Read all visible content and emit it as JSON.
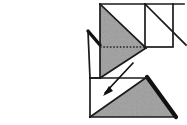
{
  "figure": {
    "kind": "origami-folding-diagram",
    "title": "",
    "caption": "",
    "background_color": "#ffffff",
    "ink_color": "#1a1a1a",
    "shaded_color": "#9d9d9d",
    "shaded_color_dark": "#8a8a8a",
    "white_color": "#ffffff",
    "crease_style": "dotted",
    "stroke_width": 1.6
  },
  "canvas": {
    "width": 187,
    "height": 125
  },
  "regions": [
    {
      "name": "upper-right-white-square",
      "fill": "white",
      "points": "100,4 173,4 173,47 145,47 145,4"
    },
    {
      "name": "upper-right-white-triangle",
      "fill": "white",
      "points": "145,4 185,4 145,47"
    },
    {
      "name": "upper-shaded-triangle",
      "fill": "shaded",
      "points": "100,4 145,47 100,78"
    },
    {
      "name": "upper-shaded-lower-wedge",
      "fill": "shaded",
      "points": "100,47 145,47 145,78 100,78"
    },
    {
      "name": "left-white-flap",
      "fill": "white",
      "points": "88,31 100,31 100,78 88,78"
    },
    {
      "name": "lower-left-white-square",
      "fill": "white",
      "points": "90,78 145,78 90,117"
    },
    {
      "name": "lower-shaded-triangle",
      "fill": "shaded",
      "points": "145,78 175,117 90,117"
    }
  ],
  "edges": [
    {
      "name": "top-edge",
      "d": "M 100,4 L 184,4"
    },
    {
      "name": "upper-square-right-edge",
      "d": "M 173,4 L 173,47"
    },
    {
      "name": "upper-square-inner-vertical",
      "d": "M 145,4 L 145,47"
    },
    {
      "name": "upper-square-bottom-edge",
      "d": "M 100,47 L 173,47"
    },
    {
      "name": "upper-left-vertical-edge",
      "d": "M 100,4 L 100,78"
    },
    {
      "name": "upper-diagonal-fold",
      "d": "M 100,4 L 146,48"
    },
    {
      "name": "upper-right-diagonal",
      "d": "M 145,4 L 186,45"
    },
    {
      "name": "shaded-lower-diagonal",
      "d": "M 100,78 L 146,48"
    },
    {
      "name": "left-flap-top-slant",
      "d": "M 88,31 L 100,44"
    },
    {
      "name": "left-flap-left-edge",
      "d": "M 88,31 L 90,78"
    },
    {
      "name": "left-flap-bottom-edge",
      "d": "M 90,78 L 100,78"
    },
    {
      "name": "lower-square-left-edge",
      "d": "M 90,78 L 90,117"
    },
    {
      "name": "lower-square-top-edge",
      "d": "M 90,78 L 145,78"
    },
    {
      "name": "lower-bottom-edge",
      "d": "M 90,117 L 176,117"
    },
    {
      "name": "lower-diagonal-fold",
      "d": "M 90,117 L 147,77"
    },
    {
      "name": "lower-right-thick-edge",
      "d": "M 147,77 L 176,117"
    }
  ],
  "crease_lines": [
    {
      "name": "horizontal-crease-dotted",
      "d": "M 100,47 L 146,47"
    }
  ],
  "arrow": {
    "name": "fold-direction-arrow",
    "label": "",
    "path": "M 133,63 L 105,93",
    "head_points": "105,93 113,90 110,86",
    "direction": "down-left"
  }
}
